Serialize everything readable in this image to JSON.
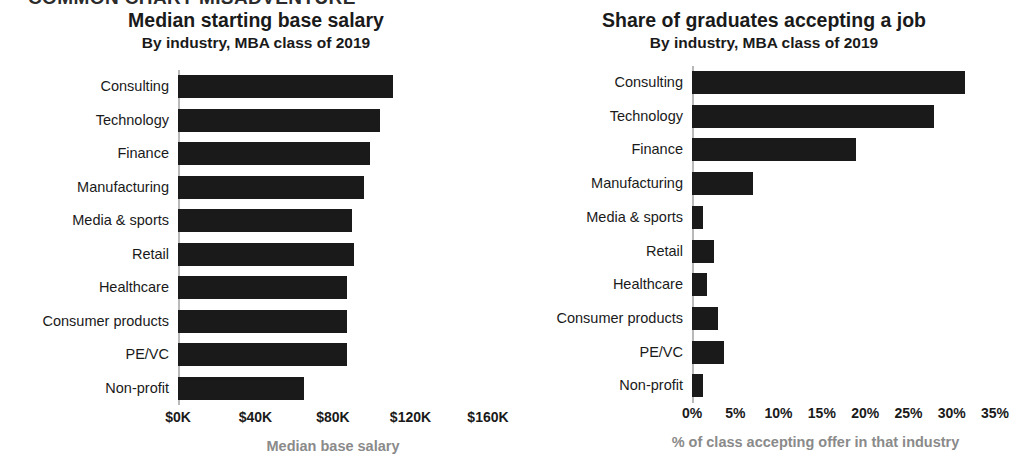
{
  "banner": "COMMON CHART MISADVENTURE",
  "chart_data": [
    {
      "type": "bar",
      "orientation": "horizontal",
      "panel": "left",
      "title": "Median starting base salary",
      "subtitle": "By industry, MBA class of 2019",
      "xlabel": "Median base salary",
      "ylabel": "",
      "categories": [
        "Consulting",
        "Technology",
        "Finance",
        "Manufacturing",
        "Media & sports",
        "Retail",
        "Healthcare",
        "Consumer products",
        "PE/VC",
        "Non-profit"
      ],
      "values": [
        111,
        104,
        99,
        96,
        90,
        91,
        87,
        87,
        87,
        65
      ],
      "value_unit": "$K",
      "xlim": [
        0,
        160
      ],
      "xticks": [
        0,
        40,
        80,
        120,
        160
      ],
      "xtick_labels": [
        "$0K",
        "$40K",
        "$80K",
        "$120K",
        "$160K"
      ],
      "grid": false,
      "legend": "none",
      "bar_color": "#1a1a1a"
    },
    {
      "type": "bar",
      "orientation": "horizontal",
      "panel": "right",
      "title": "Share of graduates accepting a job",
      "subtitle": "By industry, MBA class of 2019",
      "xlabel": "% of class accepting offer in that industry",
      "ylabel": "",
      "categories": [
        "Consulting",
        "Technology",
        "Finance",
        "Manufacturing",
        "Media & sports",
        "Retail",
        "Healthcare",
        "Consumer products",
        "PE/VC",
        "Non-profit"
      ],
      "values": [
        31.5,
        28,
        19,
        7,
        1.3,
        2.5,
        1.7,
        3,
        3.7,
        1.3
      ],
      "value_unit": "%",
      "xlim": [
        0,
        35
      ],
      "xticks": [
        0,
        5,
        10,
        15,
        20,
        25,
        30,
        35
      ],
      "xtick_labels": [
        "0%",
        "5%",
        "10%",
        "15%",
        "20%",
        "25%",
        "30%",
        "35%"
      ],
      "grid": false,
      "legend": "none",
      "bar_color": "#1a1a1a"
    }
  ]
}
